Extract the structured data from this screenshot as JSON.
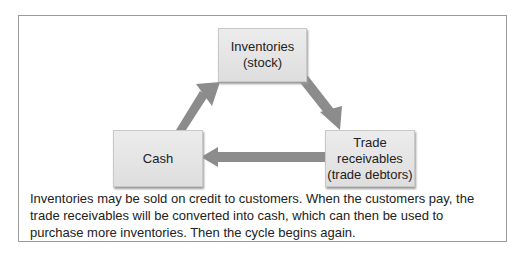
{
  "diagram": {
    "nodes": [
      {
        "id": "inventories",
        "label": "Inventories\n(stock)"
      },
      {
        "id": "cash",
        "label": "Cash"
      },
      {
        "id": "trade_receivables",
        "label": "Trade\nreceivables\n(trade debtors)"
      }
    ],
    "edges": [
      {
        "from": "inventories",
        "to": "trade_receivables"
      },
      {
        "from": "trade_receivables",
        "to": "cash"
      },
      {
        "from": "cash",
        "to": "inventories"
      }
    ],
    "arrow_color": "#8c8c8c",
    "caption": "Inventories may be sold on credit to customers. When the customers pay, the trade receivables will be converted into cash, which can then be used to purchase more inventories. Then the cycle begins again."
  }
}
